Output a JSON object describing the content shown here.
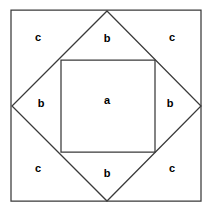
{
  "figure": {
    "type": "geometry-diagram",
    "canvas": {
      "width": 212,
      "height": 212,
      "background": "#ffffff"
    },
    "stroke_color": "#3a3a3a",
    "stroke_width": 1.25,
    "text_color": "#000000",
    "shapes": {
      "outer_square": {
        "name": "outer-square",
        "points": "11,10 201,10 201,201 11,201",
        "left": 11,
        "top": 10,
        "right": 201,
        "bottom": 201,
        "side": 190
      },
      "diamond": {
        "name": "inscribed-rotated-square",
        "points": "107,11 201,106 107,201 12,106",
        "vertices": {
          "top": [
            107,
            11
          ],
          "right": [
            201,
            106
          ],
          "bottom": [
            107,
            201
          ],
          "left": [
            12,
            106
          ]
        }
      },
      "inner_square": {
        "name": "inner-square",
        "points": "61,60 155,60 155,152 61,152",
        "left": 61,
        "top": 60,
        "right": 155,
        "bottom": 152,
        "width": 94,
        "height": 92
      }
    },
    "labels": [
      {
        "id": "label-c-top-left",
        "text": "c",
        "x": 38,
        "y": 37,
        "region": "corner-triangle-top-left"
      },
      {
        "id": "label-b-top",
        "text": "b",
        "x": 107,
        "y": 38,
        "region": "upper-band"
      },
      {
        "id": "label-c-top-right",
        "text": "c",
        "x": 172,
        "y": 37,
        "region": "corner-triangle-top-right"
      },
      {
        "id": "label-b-left",
        "text": "b",
        "x": 41,
        "y": 103,
        "region": "left-band"
      },
      {
        "id": "label-a-center",
        "text": "a",
        "x": 107,
        "y": 100,
        "region": "inner-square"
      },
      {
        "id": "label-b-right",
        "text": "b",
        "x": 170,
        "y": 103,
        "region": "right-band"
      },
      {
        "id": "label-c-bottom-left",
        "text": "c",
        "x": 38,
        "y": 168,
        "region": "corner-triangle-bottom-left"
      },
      {
        "id": "label-b-bottom",
        "text": "b",
        "x": 107,
        "y": 173,
        "region": "lower-band"
      },
      {
        "id": "label-c-bottom-right",
        "text": "c",
        "x": 172,
        "y": 168,
        "region": "corner-triangle-bottom-right"
      }
    ]
  }
}
